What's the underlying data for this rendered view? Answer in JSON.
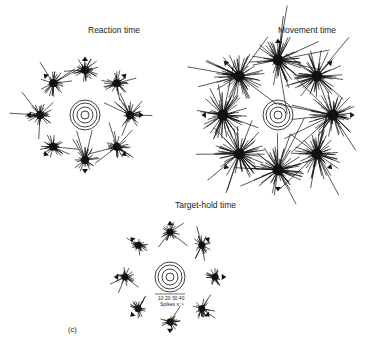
{
  "panels": [
    {
      "title": "Reaction time",
      "center": [
        85,
        115
      ],
      "cluster_radius": 45,
      "ring_radii": [
        4,
        8,
        12,
        15
      ],
      "spread": 1.0
    },
    {
      "title": "Movement time",
      "center": [
        278,
        115
      ],
      "cluster_radius": 55,
      "ring_radii": [
        4,
        8,
        12,
        15
      ],
      "spread": 1.9
    },
    {
      "title": "Target-hold time",
      "center": [
        170,
        277
      ],
      "cluster_radius": 45,
      "ring_radii": [
        4,
        8,
        12,
        15
      ],
      "spread": 0.75
    }
  ],
  "scale": {
    "ticks": "10 20 30 40",
    "unit": "Spikes s⁻¹"
  },
  "panel_label": "(c)",
  "colors": {
    "ink": "#111111",
    "background": "#ffffff"
  }
}
